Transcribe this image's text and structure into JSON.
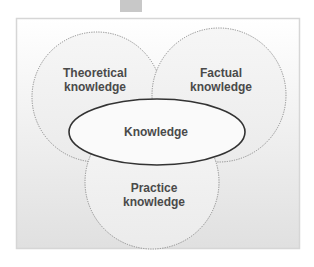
{
  "diagram": {
    "type": "overlapping-circles",
    "center": {
      "label": "Knowledge"
    },
    "circles": [
      {
        "id": "theoretical",
        "line1": "Theoretical",
        "line2": "knowledge"
      },
      {
        "id": "factual",
        "line1": "Factual",
        "line2": "knowledge"
      },
      {
        "id": "practice",
        "line1": "Practice",
        "line2": "knowledge"
      }
    ]
  },
  "colors": {
    "frame_border": "#d6d6d6",
    "background_top": "#ffffff",
    "background_bottom": "#e2e2e2",
    "circle_fill": "#efefef",
    "circle_stroke": "#8a8a8a",
    "ellipse_fill": "#fafafa",
    "ellipse_stroke": "#333333",
    "text": "#4a4a4a",
    "top_tab": "#c8c8c8"
  }
}
